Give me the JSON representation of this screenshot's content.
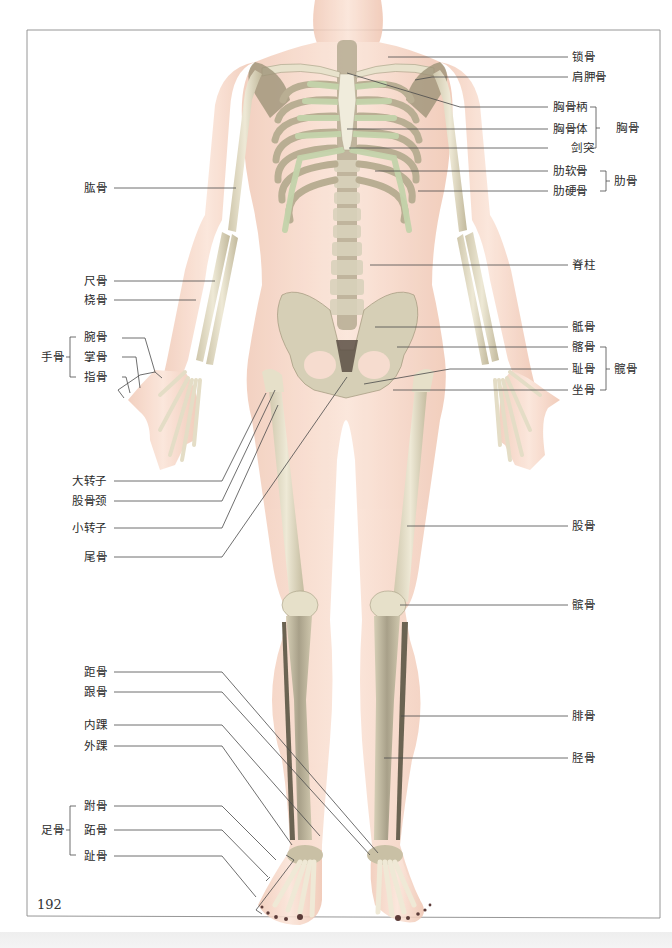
{
  "page": {
    "page_number": "192",
    "frame_color": "#8a8a8a",
    "skin_color": "#f6d7c8",
    "bone_color": "#e9e4cf",
    "cartilage_color": "#c9d6b2",
    "leader_line_color": "#555555"
  },
  "labels_right": {
    "clavicle": "锁骨",
    "scapula": "肩胛骨",
    "manubrium": "胸骨柄",
    "sternum_body": "胸骨体",
    "xiphoid": "剑突",
    "costal_cartilage": "肋软骨",
    "rib_bone": "肋硬骨",
    "spine": "脊柱",
    "sacrum": "骶骨",
    "ilium": "髂骨",
    "pubis": "耻骨",
    "ischium": "坐骨",
    "femur": "股骨",
    "patella": "髌骨",
    "fibula": "腓骨",
    "tibia": "胫骨"
  },
  "groups_right": {
    "sternum": "胸骨",
    "ribs": "肋骨",
    "hip_bone": "髋骨"
  },
  "labels_left": {
    "humerus": "肱骨",
    "ulna": "尺骨",
    "radius": "桡骨",
    "carpals": "腕骨",
    "metacarpals": "掌骨",
    "phalanges_hand": "指骨",
    "greater_trochanter": "大转子",
    "femoral_neck": "股骨颈",
    "lesser_trochanter": "小转子",
    "coccyx": "尾骨",
    "talus": "距骨",
    "calcaneus": "跟骨",
    "medial_malleolus": "内踝",
    "lateral_malleolus": "外踝",
    "tarsals": "跗骨",
    "metatarsals": "跖骨",
    "phalanges_foot": "趾骨"
  },
  "groups_left": {
    "hand_bones": "手骨",
    "foot_bones": "足骨"
  }
}
